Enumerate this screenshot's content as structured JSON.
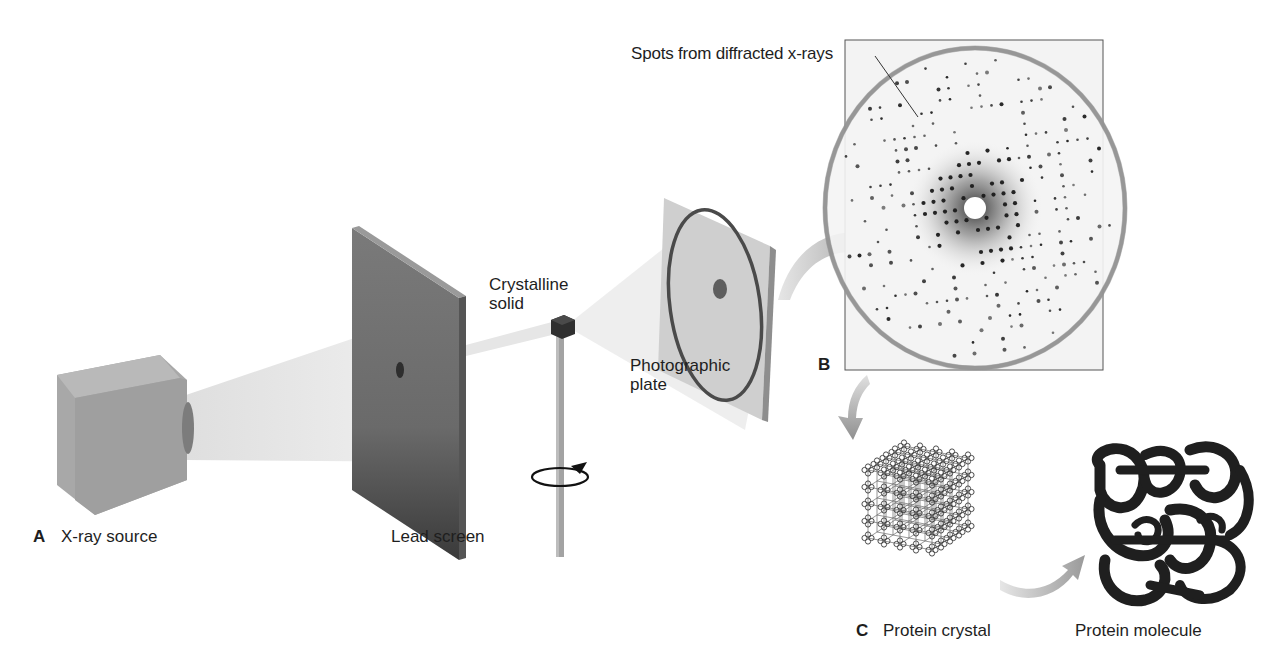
{
  "figure": {
    "panels": [
      {
        "id": "A",
        "letter": "A"
      },
      {
        "id": "B",
        "letter": "B"
      },
      {
        "id": "C",
        "letter": "C"
      }
    ],
    "labels": {
      "xray_source": "X-ray source",
      "lead_screen": "Lead screen",
      "crystalline_solid_line1": "Crystalline",
      "crystalline_solid_line2": "solid",
      "photographic_plate_line1": "Photographic",
      "photographic_plate_line2": "plate",
      "spots": "Spots from diffracted x-rays",
      "protein_crystal": "Protein crystal",
      "protein_molecule": "Protein molecule"
    },
    "colors": {
      "background": "#ffffff",
      "source_box": "#a9a9a9",
      "lead_screen": "#6e6e6e",
      "beam": "#e4e4e4",
      "plate": "#c8c8c8",
      "arrow": "#9a9a9a",
      "spots": "#1a1a1a",
      "molecule": "#222222"
    }
  }
}
